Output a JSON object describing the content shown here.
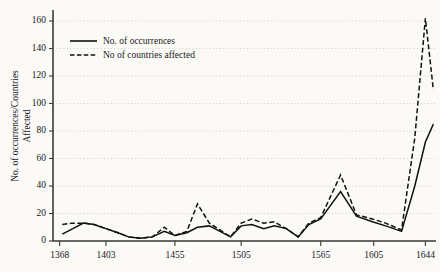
{
  "chart_data": {
    "type": "line",
    "title": "",
    "xlabel": "",
    "ylabel": "No. of occurrences/Countries Affected",
    "ylabel_line1": "No. of occurrences/Countries",
    "ylabel_line2": "Affected",
    "ylim": [
      0,
      168
    ],
    "yticks": [
      0,
      20,
      40,
      60,
      80,
      100,
      120,
      140,
      160
    ],
    "ytick_labels": [
      "0",
      "20",
      "40",
      "60",
      "80",
      "100",
      "120",
      "140",
      "160"
    ],
    "xlim": [
      1363,
      1652
    ],
    "xticks": [
      1368,
      1403,
      1455,
      1505,
      1565,
      1605,
      1644
    ],
    "xtick_labels": [
      "1368",
      "1403",
      "1455",
      "1505",
      "1565",
      "1605",
      "1644"
    ],
    "grid": true,
    "grid_axis": "y",
    "legend_position": "upper-left",
    "x": [
      1370,
      1378,
      1386,
      1394,
      1403,
      1412,
      1420,
      1429,
      1438,
      1447,
      1455,
      1464,
      1472,
      1481,
      1489,
      1497,
      1505,
      1513,
      1522,
      1530,
      1539,
      1548,
      1556,
      1565,
      1574,
      1582,
      1590,
      1598,
      1605,
      1614,
      1622,
      1631,
      1640,
      1646
    ],
    "series": [
      {
        "name": "No. of occurrences",
        "style": "solid",
        "values": [
          5,
          9,
          13,
          12,
          9,
          6,
          3,
          2,
          3,
          7,
          4,
          6,
          10,
          11,
          7,
          3,
          11,
          12,
          9,
          11,
          9,
          3,
          12,
          16,
          10,
          10,
          4,
          26,
          41,
          46,
          30,
          27,
          34,
          82
        ]
      },
      {
        "name": "No of countries affected",
        "style": "dashed",
        "values": [
          12,
          13,
          13,
          12,
          9,
          6,
          3,
          2,
          3,
          10,
          4,
          7,
          27,
          13,
          8,
          3,
          13,
          16,
          13,
          14,
          9,
          3,
          13,
          17,
          11,
          11,
          4,
          56,
          113,
          62,
          43,
          36,
          52,
          135
        ]
      }
    ],
    "series_tail": {
      "note": "second half of the record continues to 1644",
      "x": [
        1565,
        1580,
        1592,
        1604,
        1614,
        1626,
        1636,
        1644,
        1650
      ],
      "solid": [
        82,
        36,
        18,
        14,
        11,
        7,
        40,
        72,
        85
      ],
      "dashed": [
        135,
        48,
        19,
        16,
        13,
        8,
        75,
        162,
        110
      ]
    }
  },
  "legend": {
    "items": [
      {
        "label": "No. of occurrences",
        "style": "solid"
      },
      {
        "label": "No of countries affected",
        "style": "dashed"
      }
    ]
  }
}
